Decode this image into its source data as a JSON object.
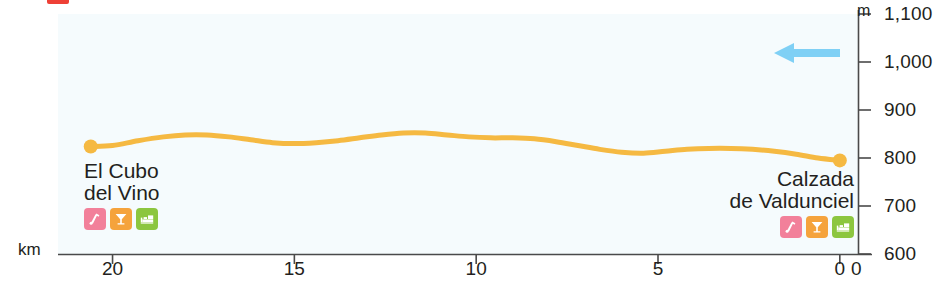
{
  "chart_data": {
    "type": "area",
    "title": "",
    "subtitle": "",
    "xlabel": "km",
    "ylabel": "m",
    "xlim": [
      21.5,
      -0.5
    ],
    "ylim": [
      600,
      1100
    ],
    "x_axis_reversed": true,
    "grid": false,
    "legend": "none",
    "x_ticks": [
      20,
      15,
      10,
      5,
      0
    ],
    "x_tick_labels": [
      "20",
      "15",
      "10",
      "5",
      "0"
    ],
    "y_ticks": [
      600,
      700,
      800,
      900,
      1000,
      1100
    ],
    "y_tick_labels": [
      "600",
      "700",
      "800",
      "900",
      "1,000",
      "1,100"
    ],
    "x_unit": "km",
    "y_unit": "m",
    "axis_origin_label": "0",
    "series": [
      {
        "name": "Elevation profile",
        "color": "#f5b942",
        "x": [
          20.6,
          20.0,
          19.3,
          18.6,
          18.0,
          17.4,
          16.8,
          16.2,
          15.6,
          15.0,
          14.4,
          13.8,
          13.2,
          12.6,
          12.0,
          11.4,
          10.8,
          10.2,
          9.6,
          9.0,
          8.4,
          7.8,
          7.2,
          6.6,
          6.0,
          5.4,
          4.8,
          4.2,
          3.6,
          3.0,
          2.4,
          1.8,
          1.2,
          0.6,
          0.0
        ],
        "y": [
          824,
          826,
          836,
          844,
          848,
          848,
          844,
          838,
          832,
          830,
          832,
          836,
          842,
          848,
          852,
          852,
          848,
          844,
          842,
          842,
          840,
          834,
          826,
          818,
          812,
          810,
          814,
          818,
          820,
          820,
          818,
          814,
          808,
          800,
          795
        ]
      }
    ],
    "markers": [
      {
        "name": "El Cubo del Vino",
        "x": 20.6,
        "y": 824
      },
      {
        "name": "Calzada de Valdunciel",
        "x": 0.0,
        "y": 795
      }
    ],
    "annotations": [
      {
        "type": "direction-arrow",
        "label": "direction of travel",
        "points": "left",
        "color": "#7fd0f5"
      }
    ]
  },
  "places": [
    {
      "id": "el-cubo-del-vino",
      "name_lines": [
        "El Cubo",
        "del Vino"
      ],
      "name_line1": "El Cubo",
      "name_line2": "del Vino",
      "align": "left",
      "distance_km": 20.6,
      "elevation_m": 824,
      "amenities": [
        {
          "icon": "hostel-icon",
          "label": "Albergue",
          "color": "#f2809a"
        },
        {
          "icon": "bar-icon",
          "label": "Bar",
          "color": "#f5a33c"
        },
        {
          "icon": "hotel-bed-icon",
          "label": "Hotel",
          "color": "#8cc63f"
        }
      ]
    },
    {
      "id": "calzada-de-valdunciel",
      "name_lines": [
        "Calzada",
        "de Valdunciel"
      ],
      "name_line1": "Calzada",
      "name_line2": "de Valdunciel",
      "align": "right",
      "distance_km": 0.0,
      "elevation_m": 795,
      "amenities": [
        {
          "icon": "hostel-icon",
          "label": "Albergue",
          "color": "#f2809a"
        },
        {
          "icon": "bar-icon",
          "label": "Bar",
          "color": "#f5a33c"
        },
        {
          "icon": "hotel-bed-icon",
          "label": "Hotel",
          "color": "#8cc63f"
        }
      ]
    }
  ],
  "colors": {
    "profile_line": "#f5b942",
    "plot_background": "#f5fbfd",
    "axis": "#4a4a4a",
    "text": "#231f20",
    "arrow": "#7fd0f5",
    "crop_mark": "#ee4036"
  }
}
